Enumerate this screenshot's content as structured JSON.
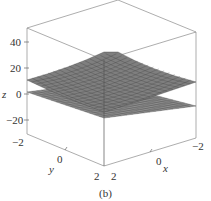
{
  "chart_data": {
    "type": "surface3d",
    "title": "",
    "caption": "(b)",
    "xlabel": "x",
    "ylabel": "y",
    "zlabel": "z",
    "x_ticks": [
      "2",
      "0",
      "−2"
    ],
    "y_ticks": [
      "−2",
      "0",
      "2"
    ],
    "z_ticks": [
      "40",
      "20",
      "0",
      "−20"
    ],
    "xlim": [
      -2,
      2
    ],
    "ylim": [
      -2,
      2
    ],
    "zlim": [
      -30,
      50
    ],
    "grid": false,
    "legend": null,
    "series": [
      {
        "name": "upper surface (paraboloid-like, opens upward)",
        "z_at_center": 0,
        "z_at_corners": 30,
        "color": "#777777"
      },
      {
        "name": "lower surface (near-flat sheet)",
        "z_at_center": -5,
        "z_at_corners": -2,
        "color": "#666666"
      }
    ],
    "surface_grid_lines": 16
  },
  "labels": {
    "z_axis": "z",
    "y_axis": "y",
    "x_axis": "x",
    "z_tick_40": "40",
    "z_tick_20": "20",
    "z_tick_0": "0",
    "z_tick_m20": "−20",
    "y_tick_m2": "−2",
    "y_tick_0": "0",
    "y_tick_2": "2",
    "x_tick_2": "2",
    "x_tick_0": "0",
    "x_tick_m2": "−2",
    "caption": "(b)"
  }
}
